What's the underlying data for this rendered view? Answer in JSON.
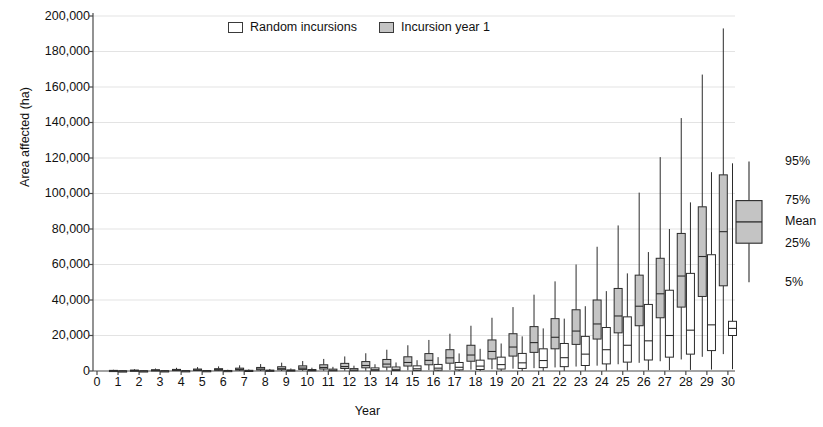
{
  "chart_data": {
    "type": "box",
    "title": "",
    "xlabel": "Year",
    "ylabel": "Area affected (ha)",
    "xlim": [
      0,
      30
    ],
    "ylim": [
      0,
      200000
    ],
    "ytick_labels": [
      "200,000",
      "180,000",
      "160,000",
      "140,000",
      "120,000",
      "100,000",
      "80,000",
      "60,000",
      "40,000",
      "20,000",
      "0"
    ],
    "ytick_values": [
      200000,
      180000,
      160000,
      140000,
      120000,
      100000,
      80000,
      60000,
      40000,
      20000,
      0
    ],
    "xtick_labels": [
      "0",
      "1",
      "2",
      "3",
      "4",
      "5",
      "6",
      "7",
      "8",
      "9",
      "10",
      "11",
      "12",
      "13",
      "14",
      "15",
      "16",
      "17",
      "18",
      "19",
      "20",
      "21",
      "22",
      "23",
      "24",
      "25",
      "26",
      "27",
      "28",
      "29",
      "30"
    ],
    "grid": "horizontal",
    "legend_position": "top-center",
    "legend": [
      {
        "label": "Random incursions",
        "fill": "#ffffff",
        "style": "open"
      },
      {
        "label": "Incursion year 1",
        "fill": "#c4c4c4",
        "style": "filled"
      }
    ],
    "box_key": {
      "labels": [
        "95%",
        "75%",
        "Mean",
        "25%",
        "5%"
      ],
      "fill": "#c4c4c4",
      "p95": 118000,
      "p75": 96000,
      "mean": 84000,
      "p25": 72000,
      "p05": 50000
    },
    "categories": [
      1,
      2,
      3,
      4,
      5,
      6,
      7,
      8,
      9,
      10,
      11,
      12,
      13,
      14,
      15,
      16,
      17,
      18,
      19,
      20,
      21,
      22,
      23,
      24,
      25,
      26,
      27,
      28,
      29,
      30
    ],
    "series": [
      {
        "name": "Incursion year 1",
        "fill": "#c4c4c4",
        "boxes": [
          {
            "x": 1,
            "p05": 0,
            "p25": 100,
            "mean": 200,
            "p75": 350,
            "p95": 700
          },
          {
            "x": 2,
            "p05": 0,
            "p25": 150,
            "mean": 300,
            "p75": 500,
            "p95": 1000
          },
          {
            "x": 3,
            "p05": 0,
            "p25": 200,
            "mean": 400,
            "p75": 700,
            "p95": 1400
          },
          {
            "x": 4,
            "p05": 0,
            "p25": 250,
            "mean": 500,
            "p75": 900,
            "p95": 1800
          },
          {
            "x": 5,
            "p05": 0,
            "p25": 300,
            "mean": 600,
            "p75": 1100,
            "p95": 2200
          },
          {
            "x": 6,
            "p05": 0,
            "p25": 400,
            "mean": 750,
            "p75": 1300,
            "p95": 2600
          },
          {
            "x": 7,
            "p05": 0,
            "p25": 500,
            "mean": 900,
            "p75": 1600,
            "p95": 3200
          },
          {
            "x": 8,
            "p05": 0,
            "p25": 600,
            "mean": 1100,
            "p75": 2000,
            "p95": 3900
          },
          {
            "x": 9,
            "p05": 0,
            "p25": 700,
            "mean": 1300,
            "p75": 2400,
            "p95": 4700
          },
          {
            "x": 10,
            "p05": 100,
            "p25": 900,
            "mean": 1600,
            "p75": 2900,
            "p95": 5600
          },
          {
            "x": 11,
            "p05": 100,
            "p25": 1100,
            "mean": 2000,
            "p75": 3500,
            "p95": 6800
          },
          {
            "x": 12,
            "p05": 200,
            "p25": 1400,
            "mean": 2500,
            "p75": 4300,
            "p95": 8200
          },
          {
            "x": 13,
            "p05": 200,
            "p25": 1800,
            "mean": 3100,
            "p75": 5300,
            "p95": 10000
          },
          {
            "x": 14,
            "p05": 300,
            "p25": 2200,
            "mean": 3900,
            "p75": 6500,
            "p95": 12000
          },
          {
            "x": 15,
            "p05": 400,
            "p25": 2800,
            "mean": 4800,
            "p75": 8000,
            "p95": 14500
          },
          {
            "x": 16,
            "p05": 500,
            "p25": 3500,
            "mean": 6000,
            "p75": 9800,
            "p95": 17500
          },
          {
            "x": 17,
            "p05": 600,
            "p25": 4400,
            "mean": 7400,
            "p75": 12000,
            "p95": 21000
          },
          {
            "x": 18,
            "p05": 800,
            "p25": 5500,
            "mean": 9000,
            "p75": 14500,
            "p95": 25500
          },
          {
            "x": 19,
            "p05": 1000,
            "p25": 6800,
            "mean": 11000,
            "p75": 17500,
            "p95": 30000
          },
          {
            "x": 20,
            "p05": 1300,
            "p25": 8400,
            "mean": 13500,
            "p75": 21000,
            "p95": 36000
          },
          {
            "x": 21,
            "p05": 1600,
            "p25": 10500,
            "mean": 16000,
            "p75": 25000,
            "p95": 43000
          },
          {
            "x": 22,
            "p05": 2000,
            "p25": 12500,
            "mean": 19000,
            "p75": 29500,
            "p95": 50500
          },
          {
            "x": 23,
            "p05": 2500,
            "p25": 15000,
            "mean": 22500,
            "p75": 34500,
            "p95": 60000
          },
          {
            "x": 24,
            "p05": 3000,
            "p25": 18000,
            "mean": 26500,
            "p75": 40000,
            "p95": 70000
          },
          {
            "x": 25,
            "p05": 3800,
            "p25": 21500,
            "mean": 31000,
            "p75": 46500,
            "p95": 82000
          },
          {
            "x": 26,
            "p05": 4600,
            "p25": 25500,
            "mean": 36500,
            "p75": 54000,
            "p95": 100500
          },
          {
            "x": 27,
            "p05": 5500,
            "p25": 30000,
            "mean": 43500,
            "p75": 63500,
            "p95": 120500
          },
          {
            "x": 28,
            "p05": 6500,
            "p25": 36000,
            "mean": 53500,
            "p75": 77500,
            "p95": 142500
          },
          {
            "x": 29,
            "p05": 8000,
            "p25": 42000,
            "mean": 64500,
            "p75": 92500,
            "p95": 167000
          },
          {
            "x": 30,
            "p05": 9500,
            "p25": 48000,
            "mean": 78500,
            "p75": 110500,
            "p95": 193000
          }
        ]
      },
      {
        "name": "Random incursions",
        "fill": "#ffffff",
        "boxes": [
          {
            "x": 1,
            "p05": 0,
            "p25": 0,
            "mean": 20,
            "p75": 60,
            "p95": 150
          },
          {
            "x": 2,
            "p05": 0,
            "p25": 0,
            "mean": 30,
            "p75": 90,
            "p95": 220
          },
          {
            "x": 3,
            "p05": 0,
            "p25": 0,
            "mean": 50,
            "p75": 130,
            "p95": 320
          },
          {
            "x": 4,
            "p05": 0,
            "p25": 0,
            "mean": 70,
            "p75": 180,
            "p95": 430
          },
          {
            "x": 5,
            "p05": 0,
            "p25": 10,
            "mean": 90,
            "p75": 230,
            "p95": 560
          },
          {
            "x": 6,
            "p05": 0,
            "p25": 20,
            "mean": 120,
            "p75": 300,
            "p95": 700
          },
          {
            "x": 7,
            "p05": 0,
            "p25": 30,
            "mean": 160,
            "p75": 390,
            "p95": 900
          },
          {
            "x": 8,
            "p05": 0,
            "p25": 40,
            "mean": 200,
            "p75": 500,
            "p95": 1150
          },
          {
            "x": 9,
            "p05": 0,
            "p25": 60,
            "mean": 260,
            "p75": 640,
            "p95": 1450
          },
          {
            "x": 10,
            "p05": 0,
            "p25": 80,
            "mean": 330,
            "p75": 820,
            "p95": 1850
          },
          {
            "x": 11,
            "p05": 0,
            "p25": 110,
            "mean": 430,
            "p75": 1050,
            "p95": 2350
          },
          {
            "x": 12,
            "p05": 0,
            "p25": 150,
            "mean": 560,
            "p75": 1350,
            "p95": 3000
          },
          {
            "x": 13,
            "p05": 0,
            "p25": 200,
            "mean": 730,
            "p75": 1750,
            "p95": 3800
          },
          {
            "x": 14,
            "p05": 0,
            "p25": 270,
            "mean": 950,
            "p75": 2250,
            "p95": 4800
          },
          {
            "x": 15,
            "p05": 0,
            "p25": 360,
            "mean": 1250,
            "p75": 2900,
            "p95": 6100
          },
          {
            "x": 16,
            "p05": 0,
            "p25": 480,
            "mean": 1600,
            "p75": 3700,
            "p95": 7800
          },
          {
            "x": 17,
            "p05": 0,
            "p25": 640,
            "mean": 2100,
            "p75": 4800,
            "p95": 9900
          },
          {
            "x": 18,
            "p05": 0,
            "p25": 850,
            "mean": 2750,
            "p75": 6100,
            "p95": 12500
          },
          {
            "x": 19,
            "p05": 0,
            "p25": 1100,
            "mean": 3600,
            "p75": 7800,
            "p95": 15500
          },
          {
            "x": 20,
            "p05": 0,
            "p25": 1450,
            "mean": 4600,
            "p75": 9900,
            "p95": 19500
          },
          {
            "x": 21,
            "p05": 100,
            "p25": 1900,
            "mean": 5900,
            "p75": 12500,
            "p95": 24000
          },
          {
            "x": 22,
            "p05": 100,
            "p25": 2450,
            "mean": 7500,
            "p75": 15500,
            "p95": 29500
          },
          {
            "x": 23,
            "p05": 200,
            "p25": 3100,
            "mean": 9500,
            "p75": 19500,
            "p95": 36500
          },
          {
            "x": 24,
            "p05": 200,
            "p25": 4000,
            "mean": 12000,
            "p75": 24500,
            "p95": 45000
          },
          {
            "x": 25,
            "p05": 300,
            "p25": 5000,
            "mean": 14500,
            "p75": 30500,
            "p95": 55000
          },
          {
            "x": 26,
            "p05": 400,
            "p25": 6200,
            "mean": 17000,
            "p75": 37500,
            "p95": 67000
          },
          {
            "x": 27,
            "p05": 500,
            "p25": 7800,
            "mean": 20000,
            "p75": 45500,
            "p95": 80000
          },
          {
            "x": 28,
            "p05": 600,
            "p25": 9500,
            "mean": 23000,
            "p75": 55000,
            "p95": 95000
          },
          {
            "x": 29,
            "p05": 800,
            "p25": 11500,
            "mean": 26000,
            "p75": 65500,
            "p95": 112000
          },
          {
            "x": 30,
            "p05": 1000,
            "p25": 20000,
            "mean": 24000,
            "p75": 28000,
            "p95": 117000
          }
        ]
      }
    ]
  }
}
